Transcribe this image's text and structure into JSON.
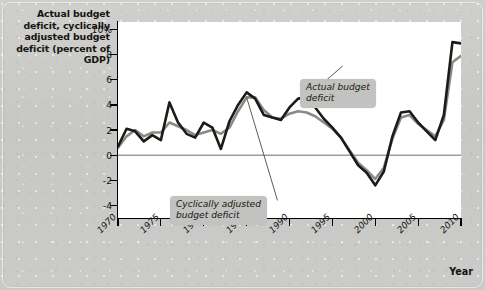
{
  "figure": {
    "y_axis_title": "Actual budget deficit,\ncyclically adjusted\nbudget deficit\n(percent of GDP)",
    "x_axis_title": "Year"
  },
  "annotations": {
    "actual": "Actual budget\ndeficit",
    "cyclical": "Cyclically adjusted\nbudget deficit"
  },
  "colors": {
    "actual_line": "#1d1b17",
    "cyclical_line": "#8a8a86",
    "plot_background": "#ffffff",
    "page_background": "#c9c9c7",
    "callout_background": "#c2c2c0",
    "axis": "#000000",
    "zero_line": "#6d6d69"
  },
  "chart_data": {
    "type": "line",
    "title": "",
    "xlabel": "Year",
    "ylabel": "Actual budget deficit, cyclically adjusted budget deficit (percent of GDP)",
    "xlim": [
      1970,
      2010
    ],
    "ylim": [
      -5,
      10.6
    ],
    "grid": false,
    "legend_position": "inline-annotations",
    "ytick_labels": [
      "10%",
      "8",
      "6",
      "4",
      "2",
      "0",
      "-2",
      "-4"
    ],
    "ytick_values": [
      10,
      8,
      6,
      4,
      2,
      0,
      -2,
      -4
    ],
    "xtick_labels": [
      "1970",
      "1975",
      "1980",
      "1985",
      "1990",
      "1995",
      "2000",
      "2005",
      "2010"
    ],
    "xtick_values": [
      1970,
      1975,
      1980,
      1985,
      1990,
      1995,
      2000,
      2005,
      2010
    ],
    "x": [
      1970,
      1971,
      1972,
      1973,
      1974,
      1975,
      1976,
      1977,
      1978,
      1979,
      1980,
      1981,
      1982,
      1983,
      1984,
      1985,
      1986,
      1987,
      1988,
      1989,
      1990,
      1991,
      1992,
      1993,
      1994,
      1995,
      1996,
      1997,
      1998,
      1999,
      2000,
      2001,
      2002,
      2003,
      2004,
      2005,
      2006,
      2007,
      2008,
      2009,
      2010
    ],
    "series": [
      {
        "name": "Actual budget deficit",
        "color": "#1d1b17",
        "values": [
          0.7,
          2.1,
          1.9,
          1.1,
          1.6,
          1.2,
          4.2,
          2.6,
          1.7,
          1.4,
          2.6,
          2.2,
          0.5,
          2.7,
          4.0,
          5.0,
          4.5,
          3.2,
          3.0,
          2.8,
          3.8,
          4.5,
          4.6,
          3.8,
          2.9,
          2.2,
          1.4,
          0.3,
          -0.8,
          -1.4,
          -2.4,
          -1.3,
          1.5,
          3.4,
          3.5,
          2.6,
          1.9,
          1.2,
          3.2,
          9.0,
          8.9
        ]
      },
      {
        "name": "Cyclically adjusted budget deficit",
        "color": "#8a8a86",
        "values": [
          0.6,
          1.5,
          2.0,
          1.5,
          1.8,
          1.8,
          2.6,
          2.3,
          2.0,
          1.6,
          1.8,
          2.0,
          1.7,
          2.2,
          3.5,
          4.6,
          4.6,
          3.6,
          3.0,
          2.9,
          3.3,
          3.5,
          3.4,
          3.1,
          2.6,
          2.1,
          1.4,
          0.4,
          -0.6,
          -1.2,
          -1.9,
          -1.0,
          1.3,
          3.0,
          3.2,
          2.5,
          2.0,
          1.5,
          2.8,
          7.4,
          7.9
        ]
      }
    ],
    "annotations": [
      {
        "text": "Actual budget deficit",
        "points_to_x": 1992,
        "points_to_y": 4.6
      },
      {
        "text": "Cyclically adjusted budget deficit",
        "points_to_x": 1985,
        "points_to_y": 4.6
      }
    ]
  }
}
